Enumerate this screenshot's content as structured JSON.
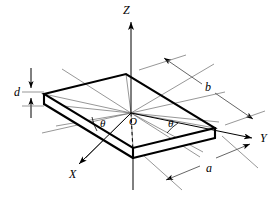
{
  "figure": {
    "title": "",
    "kind": "3d-coordinate-plate-diagram",
    "background_color": "#ffffff",
    "line_color": "#000000",
    "thin_line_color": "#555555"
  },
  "axes": [
    {
      "name": "z-axis",
      "label": "Z",
      "direction": "up",
      "label_x": 123,
      "label_y": 4
    },
    {
      "name": "y-axis",
      "label": "Y",
      "direction": "right",
      "label_x": 260,
      "label_y": 132
    },
    {
      "name": "x-axis",
      "label": "X",
      "direction": "down-left",
      "label_x": 69,
      "label_y": 168
    }
  ],
  "origin": {
    "label": "O",
    "label_x": 129,
    "label_y": 116
  },
  "angles": [
    {
      "name": "theta-left",
      "label": "θ",
      "label_x": 100,
      "label_y": 118
    },
    {
      "name": "theta-right",
      "label": "θ",
      "label_x": 168,
      "label_y": 118
    }
  ],
  "dimensions": [
    {
      "name": "thickness-d",
      "label": "d",
      "label_x": 14,
      "label_y": 86,
      "describes": "plate thickness"
    },
    {
      "name": "length-b",
      "label": "b",
      "label_x": 205,
      "label_y": 81,
      "describes": "plate side b"
    },
    {
      "name": "length-a",
      "label": "a",
      "label_x": 206,
      "label_y": 162,
      "describes": "plate side a"
    }
  ],
  "plate": {
    "name": "rectangular-plate",
    "top_face_vertices": "(44,94) (126,74) (215,128) (133,148)",
    "thickness_px": 10
  }
}
